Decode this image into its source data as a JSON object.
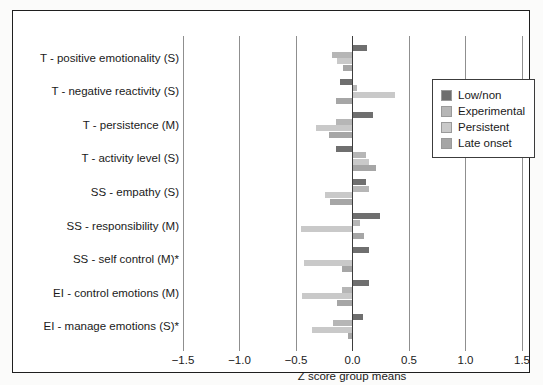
{
  "figure": {
    "background": "#ffffff",
    "border_color": "#1f1f1f"
  },
  "chart_data": {
    "type": "bar",
    "orientation": "horizontal",
    "title": "",
    "xlabel": "Z score group means",
    "xlim": [
      -1.5,
      1.5
    ],
    "xticks": [
      -1.5,
      -1.0,
      -0.5,
      0.0,
      0.5,
      1.0,
      1.5
    ],
    "xtick_labels": [
      "−1.5",
      "−1.0",
      "−0.5",
      "0.0",
      "0.5",
      "1.0",
      "1.5"
    ],
    "grid": "vertical-gridlines-at-every-tick",
    "legend_position": "upper-right-inside",
    "categories": [
      "T - positive emotionality (S)",
      "T - negative reactivity (S)",
      "T - persistence (M)",
      "T - activity level (S)",
      "SS - empathy (S)",
      "SS - responsibility (M)",
      "SS - self control (M)*",
      "EI - control emotions (M)",
      "EI - manage emotions (S)*"
    ],
    "series": [
      {
        "name": "Low/non",
        "color": "#6f6f6f",
        "values": [
          0.13,
          -0.11,
          0.18,
          -0.15,
          0.12,
          0.24,
          0.15,
          0.15,
          0.09
        ]
      },
      {
        "name": "Experimental",
        "color": "#b6b6b6",
        "values": [
          -0.18,
          0.04,
          -0.15,
          0.12,
          0.15,
          0.07,
          0.0,
          -0.09,
          -0.17
        ]
      },
      {
        "name": "Persistent",
        "color": "#c9c9c9",
        "values": [
          -0.14,
          0.38,
          -0.32,
          0.15,
          -0.24,
          -0.46,
          -0.43,
          -0.45,
          -0.36
        ]
      },
      {
        "name": "Late onset",
        "color": "#a6a6a6",
        "values": [
          -0.08,
          -0.15,
          -0.21,
          0.21,
          -0.2,
          0.1,
          -0.09,
          -0.14,
          -0.04
        ]
      }
    ]
  },
  "layout_note": "grayscale grouped horizontal bar chart of Z score group means"
}
